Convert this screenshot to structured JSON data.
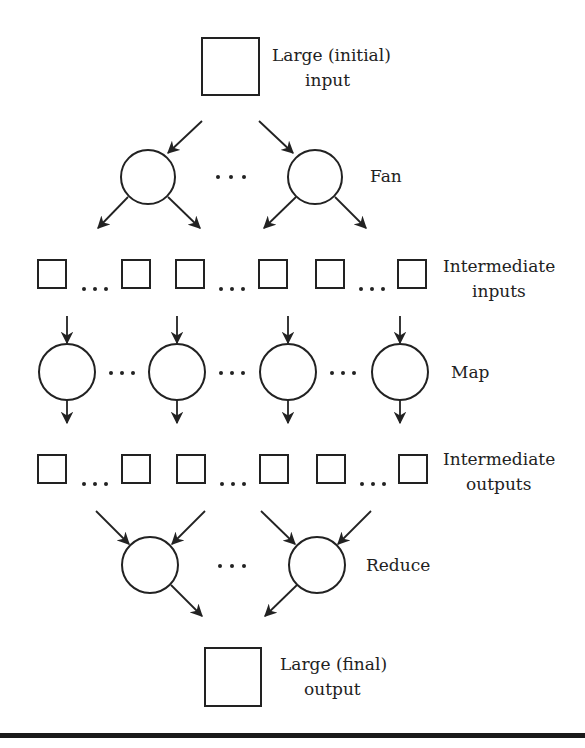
{
  "diagram": {
    "title_top": {
      "line1": "Large (initial)",
      "line2": "input"
    },
    "stage_fan": {
      "label": "Fan"
    },
    "stage_intermediate_inputs": {
      "line1": "Intermediate",
      "line2": "inputs"
    },
    "stage_map": {
      "label": "Map"
    },
    "stage_intermediate_outputs": {
      "line1": "Intermediate",
      "line2": "outputs"
    },
    "stage_reduce": {
      "label": "Reduce"
    },
    "title_bottom": {
      "line1": "Large (final)",
      "line2": "output"
    },
    "ellipsis": "…",
    "colors": {
      "stroke": "#222222",
      "background": "#ffffff"
    }
  }
}
